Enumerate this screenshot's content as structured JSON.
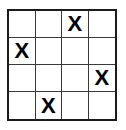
{
  "puzzle": {
    "title": "4x4 grid with X marks",
    "rows": 4,
    "columns": 4,
    "mark_symbol": "X",
    "grid_line_color": "#3a3a3a",
    "border_color": "#1b1b1b",
    "mark_color": "#000000",
    "background_color": "#ffffff",
    "cells": [
      [
        {
          "value": "",
          "marked": false
        },
        {
          "value": "",
          "marked": false
        },
        {
          "value": "X",
          "marked": true
        },
        {
          "value": "",
          "marked": false
        }
      ],
      [
        {
          "value": "X",
          "marked": true
        },
        {
          "value": "",
          "marked": false
        },
        {
          "value": "",
          "marked": false
        },
        {
          "value": "",
          "marked": false
        }
      ],
      [
        {
          "value": "",
          "marked": false
        },
        {
          "value": "",
          "marked": false
        },
        {
          "value": "",
          "marked": false
        },
        {
          "value": "X",
          "marked": true
        }
      ],
      [
        {
          "value": "",
          "marked": false
        },
        {
          "value": "X",
          "marked": true
        },
        {
          "value": "",
          "marked": false
        },
        {
          "value": "",
          "marked": false
        }
      ]
    ],
    "mark_count": 4
  }
}
